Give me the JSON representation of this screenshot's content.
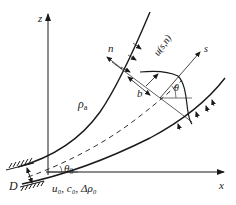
{
  "diagram": {
    "type": "curved buoyant jet schematic",
    "axes": {
      "vertical_label": "z",
      "horizontal_label": "x"
    },
    "labels": {
      "normal_coord": "n",
      "velocity_profile": "u(s,n)",
      "streamwise_coord": "s",
      "ambient_density": "ρ",
      "ambient_density_sub": "a",
      "half_width": "b",
      "local_angle": "θ",
      "initial_angle": "θ",
      "initial_angle_sub": "0",
      "nozzle_diameter": "D",
      "initial_conditions": "u₀, c₀, Δρ₀"
    },
    "colors": {
      "line": "#1a1a1a",
      "background": "#ffffff"
    }
  }
}
